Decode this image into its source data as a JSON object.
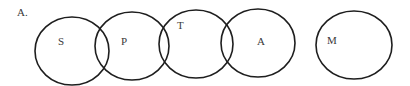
{
  "diagram": {
    "label": "A.",
    "circles": [
      {
        "id": "S",
        "label": "S",
        "cx": 72,
        "cy": 51,
        "rx": 37,
        "ry": 34,
        "lx": 58,
        "ly": 45
      },
      {
        "id": "P",
        "label": "P",
        "cx": 132,
        "cy": 46,
        "rx": 37,
        "ry": 34,
        "lx": 121,
        "ly": 45
      },
      {
        "id": "T",
        "label": "T",
        "cx": 196,
        "cy": 44,
        "rx": 37,
        "ry": 34,
        "lx": 177,
        "ly": 29
      },
      {
        "id": "A",
        "label": "A",
        "cx": 258,
        "cy": 43,
        "rx": 37,
        "ry": 34,
        "lx": 257,
        "ly": 45
      },
      {
        "id": "M",
        "label": "M",
        "cx": 354,
        "cy": 45,
        "rx": 38,
        "ry": 34,
        "lx": 327,
        "ly": 44
      }
    ],
    "stroke_color": "#1e1e1e"
  }
}
